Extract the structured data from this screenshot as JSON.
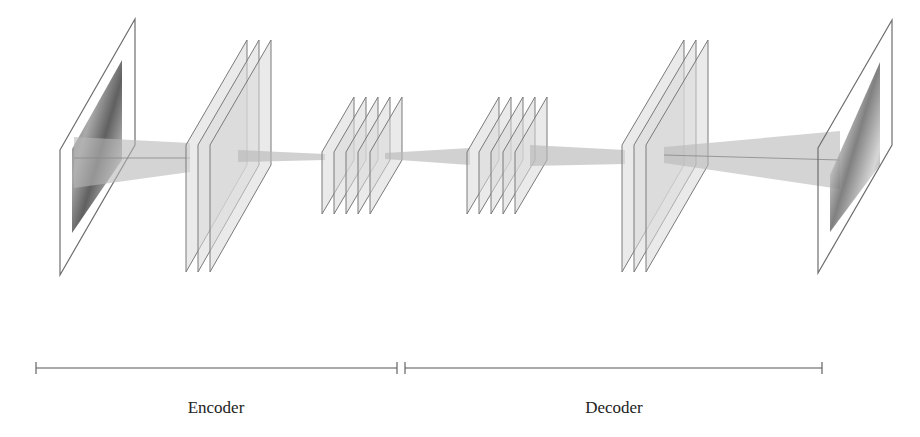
{
  "colors": {
    "background": "#ffffff",
    "plane_fill": "#d9d9d9",
    "plane_stroke": "#7a7a7a",
    "frame_stroke": "#6e6e6e",
    "connection_fill": "#b8b8b8",
    "bracket_stroke": "#555555",
    "label_text": "#222222"
  },
  "components": [
    {
      "id": "input-image",
      "kind": "image-plane",
      "description": "input photograph"
    },
    {
      "id": "encoder-block-1",
      "kind": "feature-maps",
      "planes": 3,
      "size": "large"
    },
    {
      "id": "encoder-block-2",
      "kind": "feature-maps",
      "planes": 5,
      "size": "small"
    },
    {
      "id": "decoder-block-1",
      "kind": "feature-maps",
      "planes": 5,
      "size": "small"
    },
    {
      "id": "decoder-block-2",
      "kind": "feature-maps",
      "planes": 3,
      "size": "large"
    },
    {
      "id": "output-image",
      "kind": "image-plane",
      "description": "reconstructed photograph"
    }
  ],
  "sections": [
    {
      "label": "Encoder",
      "start_x": 36,
      "end_x": 397
    },
    {
      "label": "Decoder",
      "start_x": 405,
      "end_x": 822
    }
  ]
}
